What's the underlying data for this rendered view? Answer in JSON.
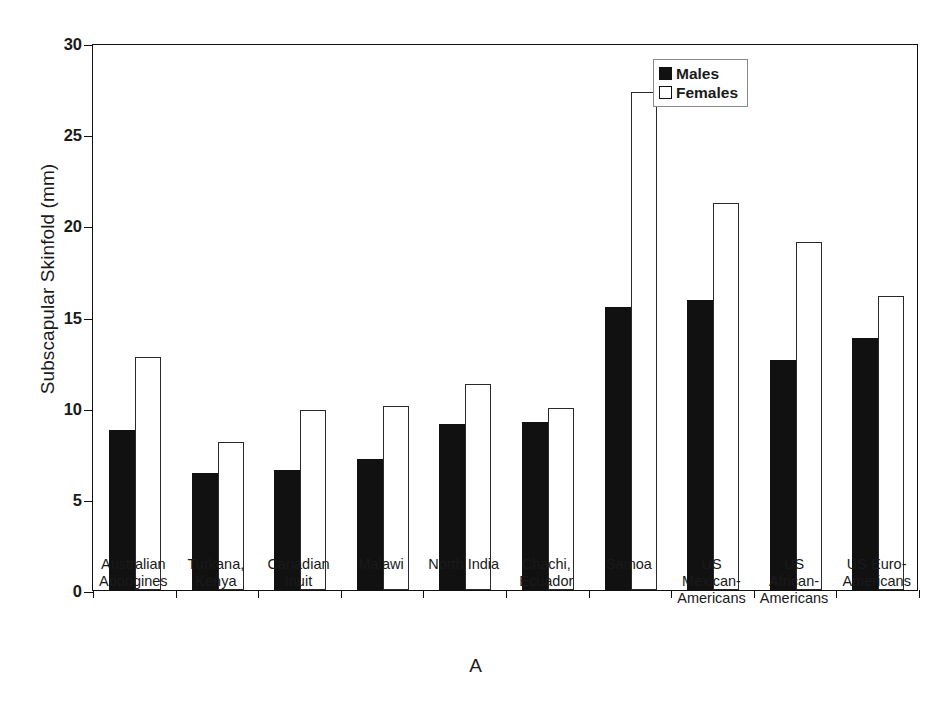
{
  "chart_data": {
    "type": "bar",
    "title": "",
    "panel_label": "A",
    "xlabel": "",
    "ylabel": "Subscapular Skinfold (mm)",
    "ylim": [
      0,
      30
    ],
    "yticks": [
      0,
      5,
      10,
      15,
      20,
      25,
      30
    ],
    "ytick_labels": [
      "0",
      "5",
      "10",
      "15",
      "20",
      "25",
      "30"
    ],
    "grid": false,
    "legend_position": "top-right",
    "categories": [
      "Australian Aborigines",
      "Turkana, Kenya",
      "Canadian Inuit",
      "Malawi",
      "North India",
      "Chachi, Ecuador",
      "Samoa",
      "US Mexican-Americans",
      "US African-Americans",
      "US Euro-Americans"
    ],
    "category_lines": [
      [
        "Australian",
        "Aborigines"
      ],
      [
        "Turkana,",
        "Kenya"
      ],
      [
        "Canadian",
        "Inuit"
      ],
      [
        "Malawi"
      ],
      [
        "North India"
      ],
      [
        "Chachi,",
        "Ecuador"
      ],
      [
        "Samoa"
      ],
      [
        "US",
        "Mexican-",
        "Americans"
      ],
      [
        "US",
        "African-",
        "Americans"
      ],
      [
        "US Euro-",
        "Americans"
      ]
    ],
    "series": [
      {
        "name": "Males",
        "color": "#111111",
        "values": [
          8.8,
          6.4,
          6.6,
          7.2,
          9.1,
          9.2,
          15.5,
          15.9,
          12.6,
          13.8
        ]
      },
      {
        "name": "Females",
        "color": "#ffffff",
        "values": [
          12.8,
          8.1,
          9.9,
          10.1,
          11.3,
          10.0,
          27.3,
          21.2,
          19.1,
          16.1
        ]
      }
    ]
  },
  "legend": {
    "items": [
      {
        "label": "Males"
      },
      {
        "label": "Females"
      }
    ]
  }
}
